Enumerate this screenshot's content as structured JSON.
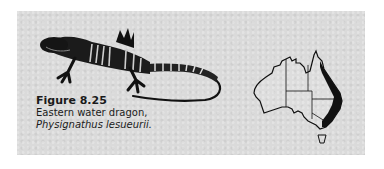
{
  "figure": {
    "number": "Figure 8.25",
    "description": "Eastern water dragon,",
    "scientific_name": "Physignathus lesueurii."
  },
  "illustrations": {
    "animal": "eastern-water-dragon-drawing",
    "map": "australia-distribution-map",
    "distribution_region": "east coast of Australia (Queensland to Victoria)"
  },
  "colors": {
    "panel": "#dadada",
    "ink": "#111111"
  }
}
